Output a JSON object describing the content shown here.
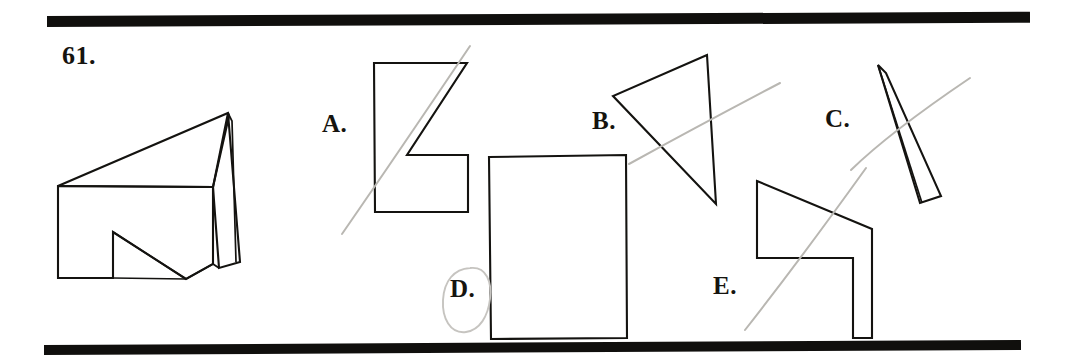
{
  "page": {
    "width": 1076,
    "height": 362,
    "background": "#ffffff",
    "ink_color": "#141310",
    "pencil_color": "#b9b7b2",
    "rule_color": "#100f0d"
  },
  "question": {
    "number_label": "61.",
    "kind": "visual-puzzle-figure-matching"
  },
  "rules": {
    "top_label": "top-horizontal-rule",
    "bottom_label": "bottom-horizontal-rule"
  },
  "prompt_figure": {
    "name": "three-dimensional-wedge-solid",
    "description_hidden": false
  },
  "options": [
    {
      "id": "A",
      "label": "A.",
      "shape": "notched-polygon-z-block",
      "marked": false
    },
    {
      "id": "B",
      "label": "B.",
      "shape": "scalene-triangle",
      "marked": false
    },
    {
      "id": "C",
      "label": "C.",
      "shape": "thin-sliver-quadrilateral",
      "marked": false
    },
    {
      "id": "D",
      "label": "D.",
      "shape": "rectangle",
      "marked": true
    },
    {
      "id": "E",
      "label": "E.",
      "shape": "stepped-flag-polygon",
      "marked": false
    }
  ],
  "annotations": {
    "selected_option": "D",
    "selection_mark": "hand-drawn-ellipse-around-label",
    "pencil_strokes": 4
  }
}
